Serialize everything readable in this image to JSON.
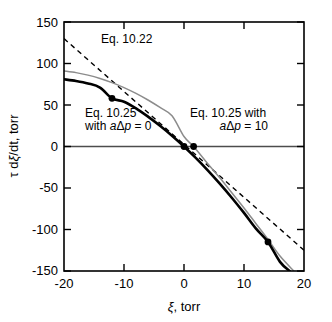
{
  "chart_data": {
    "type": "line",
    "title": "",
    "xlabel": "ξ, torr",
    "ylabel": "τ dξ/dt, torr",
    "xlim": [
      -20,
      20
    ],
    "ylim": [
      -150,
      150
    ],
    "xticks": [
      -20,
      -10,
      0,
      10,
      20
    ],
    "yticks": [
      150,
      100,
      50,
      0,
      -50,
      -100,
      -150
    ],
    "xticklabels": [
      "-20",
      "-10",
      "0",
      "10",
      "20"
    ],
    "yticklabels": [
      "150",
      "100",
      "50",
      "0",
      "-50",
      "-100",
      "-150"
    ],
    "grid": false,
    "legend_position": "none",
    "series": [
      {
        "name": "Eq. 10.25 with aΔp = 0",
        "style": "solid-thick-black",
        "color": "#000000",
        "x": [
          -20,
          -18,
          -16,
          -14,
          -12,
          -10,
          -8,
          -6,
          -4,
          -2,
          0,
          2,
          4,
          6,
          8,
          10,
          12,
          14,
          16,
          17.6
        ],
        "y": [
          81,
          79,
          76,
          71,
          58,
          54,
          46,
          36,
          25,
          13,
          0,
          -14,
          -29,
          -45,
          -62,
          -80,
          -99,
          -115,
          -139,
          -150
        ]
      },
      {
        "name": "Eq. 10.25 with aΔp = 10",
        "style": "solid-thin-gray",
        "color": "#808080",
        "x": [
          -20,
          -18,
          -16,
          -14,
          -12,
          -10,
          -8,
          -6,
          -4,
          -2,
          0,
          1.6,
          4,
          6,
          8,
          10,
          12,
          14,
          16,
          18.3
        ],
        "y": [
          91,
          89,
          86,
          82,
          77,
          71,
          64,
          56,
          47,
          37,
          12,
          0,
          -21,
          -38,
          -56,
          -74,
          -93,
          -112,
          -132,
          -150
        ]
      },
      {
        "name": "Eq. 10.22",
        "style": "dashed-black",
        "color": "#000000",
        "x": [
          -20,
          20
        ],
        "y": [
          130,
          -125
        ]
      }
    ],
    "markers": [
      {
        "x": -12,
        "y": 58,
        "shape": "filled-circle",
        "color": "#000000"
      },
      {
        "x": 0,
        "y": 0,
        "shape": "filled-circle",
        "color": "#000000"
      },
      {
        "x": 1.6,
        "y": 0,
        "shape": "filled-circle",
        "color": "#000000"
      },
      {
        "x": 14,
        "y": -115,
        "shape": "filled-circle",
        "color": "#000000"
      }
    ],
    "annotations": [
      {
        "id": "eq-10-22",
        "lines": [
          "Eq. 10.22"
        ],
        "x": -13.5,
        "y": 128,
        "align": "start"
      },
      {
        "id": "eq-10-25-adp-0",
        "lines": [
          "Eq. 10.25",
          "with aΔp = 0"
        ],
        "x": -16.5,
        "y": 36,
        "align": "start"
      },
      {
        "id": "eq-10-25-adp-10",
        "lines": [
          "Eq. 10.25 with",
          "aΔp = 10"
        ],
        "x": 1.0,
        "y": 36,
        "align": "start"
      }
    ]
  },
  "annotation_text": {
    "eq_10_22": "Eq. 10.22",
    "eq_10_25_line1": "Eq. 10.25",
    "eq_10_25_line2_prefix": "with ",
    "eq_10_25_line2_italic_a": "a",
    "eq_10_25_line2_delta": "Δ",
    "eq_10_25_line2_italic_p": "p",
    "eq_10_25_line2_suffix": " = 0",
    "eq_10_25b_line1": "Eq. 10.25 with",
    "eq_10_25b_line2_italic_a": "a",
    "eq_10_25b_line2_delta": "Δ",
    "eq_10_25b_line2_italic_p": "p",
    "eq_10_25b_line2_suffix": " = 10"
  },
  "axis_labels": {
    "x_title_xi": "ξ",
    "x_title_rest": ", torr",
    "y_title_tau": "τ d",
    "y_title_xi": "ξ",
    "y_title_rest": "/dt, torr"
  },
  "colors": {
    "frame": "#000000",
    "curve_primary": "#000000",
    "curve_secondary": "#808080",
    "background": "#ffffff"
  }
}
